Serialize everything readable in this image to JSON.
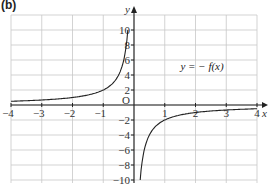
{
  "figure_label": "(b)",
  "chart_data": {
    "type": "line",
    "title": "",
    "figure_label": "(b)",
    "xlabel": "x",
    "ylabel": "y",
    "xlim": [
      -4,
      4
    ],
    "ylim": [
      -10,
      12
    ],
    "grid": true,
    "x_ticks": [
      -4,
      -3,
      -2,
      -1,
      1,
      2,
      3,
      4
    ],
    "x_tick_labels": [
      "−4",
      "−3",
      "−2",
      "−1",
      "1",
      "2",
      "3",
      "4"
    ],
    "y_ticks": [
      10,
      8,
      6,
      4,
      2,
      -2,
      -4,
      -6,
      -8,
      -10
    ],
    "y_tick_labels": [
      "10",
      "8",
      "6",
      "4",
      "2",
      "−2",
      "−4",
      "−6",
      "−8",
      "−10"
    ],
    "origin_label": "O",
    "annotations": [
      {
        "text": "y = − f(x)",
        "x": 1.9,
        "y": 5.2
      }
    ],
    "series": [
      {
        "name": "y = − f(x)",
        "branch": "x < 0",
        "x": [
          -4,
          -3,
          -2,
          -1.5,
          -1,
          -0.75,
          -0.5,
          -0.35,
          -0.25,
          -0.2
        ],
        "y": [
          0.5,
          0.67,
          1,
          1.33,
          2,
          2.67,
          4,
          5.7,
          8,
          10
        ]
      },
      {
        "name": "y = − f(x)",
        "branch": "x > 0",
        "x": [
          0.2,
          0.25,
          0.35,
          0.5,
          0.75,
          1,
          1.5,
          2,
          3,
          4
        ],
        "y": [
          -10,
          -8,
          -5.7,
          -4,
          -2.67,
          -2,
          -1.33,
          -1,
          -0.67,
          -0.5
        ]
      }
    ],
    "colors": {
      "grid": "#c8c8c8",
      "axis": "#222222",
      "curve": "#222222"
    }
  }
}
